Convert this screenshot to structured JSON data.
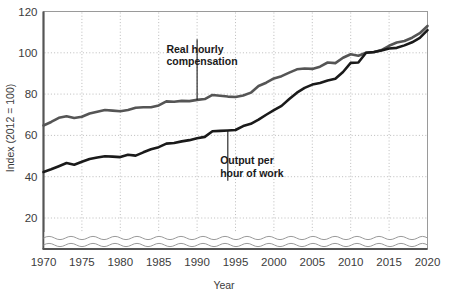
{
  "chart_data": {
    "type": "line",
    "title": "",
    "xlabel": "Year",
    "ylabel": "Index (2012 = 100)",
    "xlim": [
      1970,
      2020
    ],
    "ylim": [
      0,
      120
    ],
    "y_axis_break": true,
    "grid": true,
    "legend_position": "inline-annotations",
    "xticks": [
      1970,
      1975,
      1980,
      1985,
      1990,
      1995,
      2000,
      2005,
      2010,
      2015,
      2020
    ],
    "yticks": [
      20,
      40,
      60,
      80,
      100,
      120
    ],
    "xtick_labels": [
      "1970",
      "1975",
      "1980",
      "1985",
      "1990",
      "1995",
      "2000",
      "2005",
      "2010",
      "2015",
      "2020"
    ],
    "ytick_labels": [
      "20",
      "40",
      "60",
      "80",
      "100",
      "120"
    ],
    "x": [
      1970,
      1971,
      1972,
      1973,
      1974,
      1975,
      1976,
      1977,
      1978,
      1979,
      1980,
      1981,
      1982,
      1983,
      1984,
      1985,
      1986,
      1987,
      1988,
      1989,
      1990,
      1991,
      1992,
      1993,
      1994,
      1995,
      1996,
      1997,
      1998,
      1999,
      2000,
      2001,
      2002,
      2003,
      2004,
      2005,
      2006,
      2007,
      2008,
      2009,
      2010,
      2011,
      2012,
      2013,
      2014,
      2015,
      2016,
      2017,
      2018,
      2019,
      2020
    ],
    "series": [
      {
        "name": "Real hourly compensation",
        "color": "#555555",
        "values": [
          64.8,
          66.5,
          68.5,
          69.3,
          68.4,
          69.0,
          70.6,
          71.5,
          72.3,
          72.0,
          71.7,
          72.3,
          73.4,
          73.6,
          73.6,
          74.5,
          76.5,
          76.3,
          76.7,
          76.6,
          77.2,
          77.6,
          79.6,
          79.2,
          78.8,
          78.6,
          79.3,
          80.7,
          83.9,
          85.5,
          87.6,
          88.7,
          90.4,
          92.0,
          92.4,
          92.2,
          93.3,
          95.3,
          95.0,
          97.6,
          99.3,
          98.6,
          100.0,
          100.3,
          101.3,
          103.4,
          105.0,
          105.7,
          107.3,
          109.5,
          113.0
        ]
      },
      {
        "name": "Output per hour of work",
        "color": "#1a1a1a",
        "values": [
          42.3,
          43.6,
          45.1,
          46.6,
          45.8,
          47.2,
          48.6,
          49.3,
          49.9,
          49.7,
          49.5,
          50.6,
          50.2,
          51.8,
          53.3,
          54.3,
          56.0,
          56.3,
          57.1,
          57.7,
          58.6,
          59.3,
          62.0,
          62.2,
          62.4,
          62.6,
          64.5,
          65.6,
          67.6,
          70.0,
          72.2,
          74.3,
          77.6,
          80.7,
          83.0,
          84.6,
          85.4,
          86.6,
          87.4,
          90.7,
          95.1,
          95.3,
          100.0,
          100.4,
          101.1,
          102.1,
          102.4,
          103.6,
          105.1,
          107.2,
          111.0
        ]
      }
    ],
    "annotations": [
      {
        "id": "real-hourly-compensation",
        "lines": [
          "Real hourly",
          "compensation"
        ],
        "target_x": 1990,
        "target_y": 77.2,
        "text_x": 1986,
        "text_y": 100
      },
      {
        "id": "output-per-hour-of-work",
        "lines": [
          "Output per",
          "hour of work"
        ],
        "target_x": 1994,
        "target_y": 62.4,
        "text_x": 1993,
        "text_y": 46
      }
    ]
  }
}
